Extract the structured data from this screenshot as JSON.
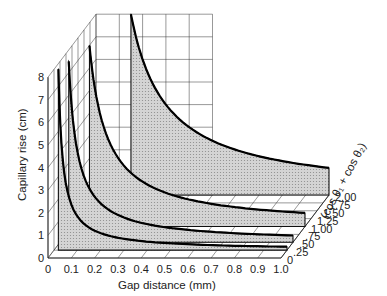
{
  "chart_data": {
    "type": "area",
    "subtype": "3d-waterfall",
    "title": "",
    "xlabel": "Gap distance (mm)",
    "ylabel": "Capillary rise (cm)",
    "zlabel": "(cos θ1 + cos θ2)",
    "x_ticks": [
      "0",
      "0.1",
      "0.2",
      "0.3",
      "0.4",
      "0.5",
      "0.6",
      "0.7",
      "0.8",
      "0.9",
      "1.0"
    ],
    "y_ticks": [
      "0",
      "1",
      "2",
      "3",
      "4",
      "5",
      "6",
      "7",
      "8"
    ],
    "z_ticks": [
      "0",
      ".25",
      ".50",
      ".75",
      "1.00",
      "1.25",
      "1.50",
      "1.75",
      "2.00"
    ],
    "xlim": [
      0,
      1.0
    ],
    "ylim": [
      0,
      8
    ],
    "zlim": [
      0,
      2.0
    ],
    "grid": true,
    "series": [
      {
        "name": "cos θ1 + cos θ2 = 0.25",
        "depth": 0.25,
        "x": [
          0.04,
          0.05,
          0.1,
          0.2,
          0.3,
          0.5,
          0.7,
          1.0
        ],
        "values": [
          8.0,
          4.5,
          1.5,
          0.75,
          0.5,
          0.3,
          0.21,
          0.15
        ]
      },
      {
        "name": "cos θ1 + cos θ2 = 0.50",
        "depth": 0.5,
        "x": [
          0.06,
          0.08,
          0.1,
          0.2,
          0.3,
          0.5,
          0.7,
          1.0
        ],
        "values": [
          8.0,
          5.0,
          3.0,
          1.5,
          1.0,
          0.6,
          0.43,
          0.3
        ]
      },
      {
        "name": "cos θ1 + cos θ2 = 1.00",
        "depth": 1.0,
        "x": [
          0.1,
          0.15,
          0.2,
          0.3,
          0.5,
          0.7,
          1.0
        ],
        "values": [
          8.0,
          4.0,
          3.0,
          2.0,
          1.2,
          0.86,
          0.6
        ]
      },
      {
        "name": "cos θ1 + cos θ2 = 2.00",
        "depth": 2.0,
        "x": [
          0.15,
          0.2,
          0.3,
          0.5,
          0.7,
          1.0
        ],
        "values": [
          8.0,
          6.0,
          4.0,
          2.4,
          1.7,
          1.2
        ]
      }
    ]
  },
  "labels": {
    "xlabel": "Gap distance (mm)",
    "ylabel": "Capillary rise (cm)",
    "zlabel": "(cos θ₁ + cos θ₂)"
  }
}
